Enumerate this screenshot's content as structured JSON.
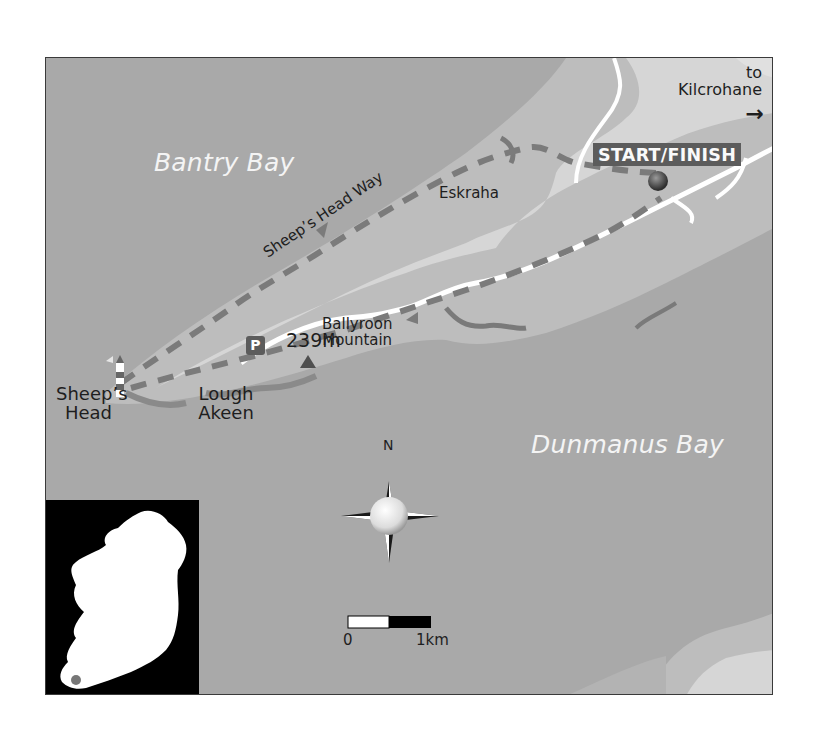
{
  "map": {
    "sea_labels": {
      "bantry": "Bantry Bay",
      "dunmanus": "Dunmanus Bay"
    },
    "places": {
      "sheeps_head_line1": "Sheep’s",
      "sheeps_head_line2": "Head",
      "lough_line1": "Lough",
      "lough_line2": "Akeen",
      "eskraha": "Eskraha",
      "mountain_line1": "Ballyroon",
      "mountain_line2": "Mountain",
      "elevation": "239m"
    },
    "route": {
      "name": "Sheep’s Head Way",
      "start_finish": "START/FINISH"
    },
    "direction": {
      "line1": "to",
      "line2": "Kilcrohane",
      "arrow": "→"
    },
    "parking": "P",
    "compass": {
      "north": "N"
    },
    "scale": {
      "start": "0",
      "end": "1km"
    },
    "colors": {
      "sea": "#a9a9a9",
      "land_mid": "#bdbdbd",
      "land_high": "#d6d6d6",
      "route_dash": "#7b7b7b",
      "road": "#ffffff",
      "badge": "#5c5c5c"
    }
  }
}
